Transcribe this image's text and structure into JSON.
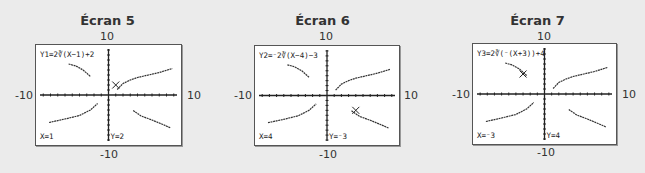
{
  "figure": {
    "background": "#ebebeb",
    "window": {
      "xmin": -10,
      "xmax": 10,
      "ymin": -10,
      "ymax": 10
    },
    "curves": [
      {
        "name": "upper-left",
        "points": [
          [
            -5.5,
            6.2
          ],
          [
            -4.5,
            5.8
          ],
          [
            -3.5,
            5.0
          ],
          [
            -2.5,
            3.7
          ]
        ]
      },
      {
        "name": "upper-right",
        "points": [
          [
            1.2,
            1.1
          ],
          [
            2,
            2.3
          ],
          [
            3,
            3.0
          ],
          [
            4,
            3.5
          ],
          [
            5.5,
            4.0
          ],
          [
            7,
            4.5
          ],
          [
            8.8,
            5.3
          ]
        ]
      },
      {
        "name": "lower-left",
        "points": [
          [
            -8.2,
            -5.5
          ],
          [
            -6,
            -4.8
          ],
          [
            -4,
            -4.1
          ],
          [
            -2.5,
            -3.0
          ],
          [
            -1.5,
            -1.7
          ]
        ]
      },
      {
        "name": "lower-right",
        "points": [
          [
            3.4,
            -3.1
          ],
          [
            4.5,
            -4.2
          ],
          [
            6,
            -5.0
          ],
          [
            7.5,
            -5.9
          ],
          [
            8.6,
            -6.6
          ]
        ]
      }
    ]
  },
  "screens": [
    {
      "title": "Écran 5",
      "ymax_label": "10",
      "ymin_label": "-10",
      "xmin_label": "-10",
      "xmax_label": "10",
      "equation": "Y1=2∛(X−1)+2",
      "x_readout": "X=1",
      "y_readout": "Y=2",
      "cursor": {
        "x": 1,
        "y": 2
      },
      "box": {
        "left": 35,
        "top": 44,
        "width": 147,
        "height": 102
      }
    },
    {
      "title": "Écran 6",
      "ymax_label": "10",
      "ymin_label": "-10",
      "xmin_label": "-10",
      "xmax_label": "10",
      "equation": "Y2=⁻2∛(X−4)−3",
      "x_readout": "X=4",
      "y_readout": "Y=⁻3",
      "cursor": {
        "x": 4,
        "y": -3
      },
      "box": {
        "left": 254,
        "top": 45,
        "width": 146,
        "height": 101
      }
    },
    {
      "title": "Écran 7",
      "ymax_label": "10",
      "ymin_label": "-10",
      "xmin_label": "-10",
      "xmax_label": "10",
      "equation": "Y3=2∛(⁻(X+3))+4",
      "x_readout": "X=⁻3",
      "y_readout": "Y=4",
      "cursor": {
        "x": -3,
        "y": 4
      },
      "box": {
        "left": 472,
        "top": 43,
        "width": 145,
        "height": 102
      }
    }
  ],
  "chart_data": [
    {
      "type": "line",
      "title": "Écran 5",
      "function": "Y1=2∛(X−1)+2",
      "xlim": [
        -10,
        10
      ],
      "ylim": [
        -10,
        10
      ],
      "trace_point": [
        1,
        2
      ]
    },
    {
      "type": "line",
      "title": "Écran 6",
      "function": "Y2=⁻2∛(X−4)−3",
      "xlim": [
        -10,
        10
      ],
      "ylim": [
        -10,
        10
      ],
      "trace_point": [
        4,
        -3
      ]
    },
    {
      "type": "line",
      "title": "Écran 7",
      "function": "Y3=2∛(⁻(X+3))+4",
      "xlim": [
        -10,
        10
      ],
      "ylim": [
        -10,
        10
      ],
      "trace_point": [
        -3,
        4
      ]
    }
  ]
}
